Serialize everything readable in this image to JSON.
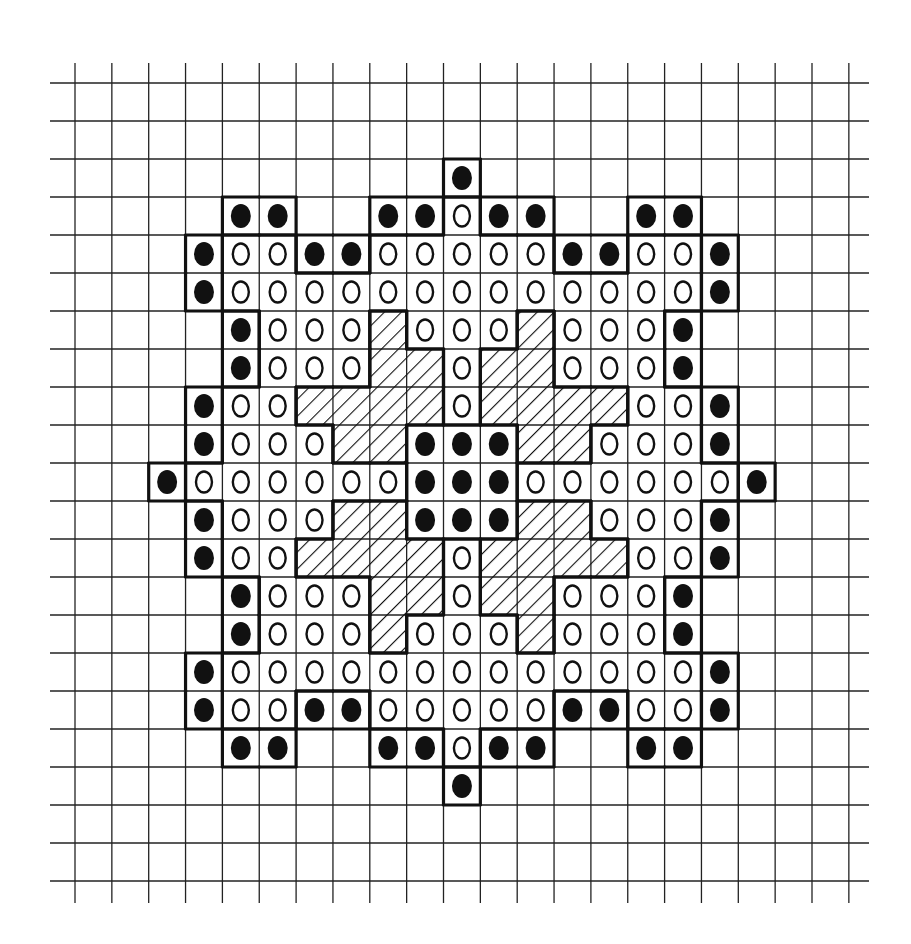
{
  "diagram": {
    "type": "bead-pattern-grid",
    "rows": 21,
    "cols": 21,
    "legend_codes": {
      ".": "empty",
      "B": "filled-black-bead",
      "O": "open-bead",
      "H": "hatched-cell"
    },
    "grid": [
      ".....................",
      ".....................",
      "..........B..........",
      "....BB..BBOBB..BB....",
      "...BOOBBOOOOOBBOOB...",
      "...BOOOOOOOOOOOOOB...",
      "....BOOOHOOOHOOOB....",
      "....BOOOHHOHHOOOB....",
      "...BOOHHHHOHHHHOOB...",
      "...BOOOHHBBBHHOOOB...",
      "..BOOOOOOBBBOOOOOOB..",
      "...BOOOHHBBBHHOOOB...",
      "...BOOHHHHOHHHHOOB...",
      "....BOOOHHOHHOOOB....",
      "....BOOOHOOOHOOOB....",
      "...BOOOOOOOOOOOOOB...",
      "...BOOBBOOOOOBBOOB...",
      "....BB..BBOBB..BB....",
      "..........B..........",
      ".....................",
      "....................."
    ],
    "colors": {
      "background": "#ffffff",
      "ink": "#111111",
      "grid_line": "#222222"
    }
  }
}
